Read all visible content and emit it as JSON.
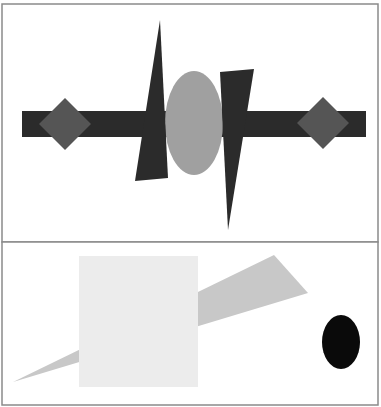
{
  "canvas": {
    "width": 381,
    "height": 407,
    "background": "#ffffff"
  },
  "panels": [
    {
      "name": "top-panel",
      "border_color": "#8a8a8a",
      "shapes": [
        {
          "name": "horizontal-bar",
          "type": "rect",
          "x": 22,
          "y": 111,
          "w": 344,
          "h": 26,
          "fill": "#2b2b2b"
        },
        {
          "name": "left-diamond",
          "type": "polygon",
          "points": "65,98 91,124 65,150 39,124",
          "fill": "#555555"
        },
        {
          "name": "right-diamond",
          "type": "polygon",
          "points": "323,97 349,123 323,149 297,123",
          "fill": "#555555"
        },
        {
          "name": "ellipse",
          "type": "ellipse",
          "cx": 194,
          "cy": 123,
          "rx": 29,
          "ry": 52,
          "fill": "#a0a0a0"
        },
        {
          "name": "left-triangle",
          "type": "polygon",
          "points": "160,20 168,178 135,181",
          "fill": "#2b2b2b"
        },
        {
          "name": "right-triangle",
          "type": "polygon",
          "points": "220,72 254,69 228,230",
          "fill": "#2b2b2b"
        }
      ]
    },
    {
      "name": "bottom-panel",
      "border_color": "#8a8a8a",
      "shapes": [
        {
          "name": "wedge",
          "type": "polygon",
          "points": "274,255 308,293 13,382",
          "fill": "#c8c8c8"
        },
        {
          "name": "square",
          "type": "rect",
          "x": 79,
          "y": 256,
          "w": 119,
          "h": 131,
          "fill": "#ececec"
        },
        {
          "name": "black-ellipse",
          "type": "ellipse",
          "cx": 341,
          "cy": 342,
          "rx": 19,
          "ry": 27,
          "fill": "#0a0a0a"
        }
      ]
    }
  ]
}
